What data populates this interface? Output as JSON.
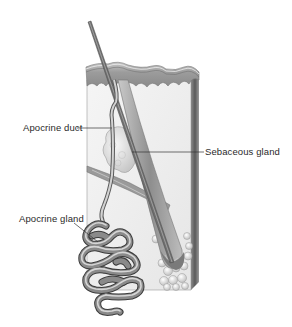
{
  "figure": {
    "type": "anatomical-illustration",
    "labels": [
      {
        "id": "apocrine-duct",
        "text": "Apocrine duct"
      },
      {
        "id": "sebaceous-gland",
        "text": "Sebaceous gland"
      },
      {
        "id": "apocrine-gland",
        "text": "Apocrine gland"
      }
    ],
    "colors": {
      "background": "#ffffff",
      "skin_surface": "#9a9a9a",
      "dermis": "#f0f0f0",
      "hair": "#6e6e6e",
      "gland": "#7a7a7a",
      "label_text": "#2a2a2a",
      "leader_line": "#333333"
    }
  },
  "caption": {
    "text": "",
    "clipped": true
  }
}
